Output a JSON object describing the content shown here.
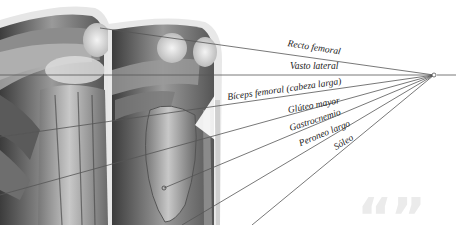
{
  "diagram": {
    "hub": {
      "x": 434,
      "y": 75
    },
    "labels": [
      {
        "text": "Recto femoral",
        "x": 287,
        "y": 42,
        "rotate": 9
      },
      {
        "text": "Vasto lateral",
        "x": 290,
        "y": 62,
        "rotate": 0
      },
      {
        "text": "Bíceps femoral (cabeza larga)",
        "x": 228,
        "y": 88,
        "rotate": -8
      },
      {
        "text": "Glúteo mayor",
        "x": 289,
        "y": 100,
        "rotate": -11
      },
      {
        "text": "Gastrocnemio",
        "x": 292,
        "y": 118,
        "rotate": -17
      },
      {
        "text": "Peroneo largo",
        "x": 302,
        "y": 135,
        "rotate": -22
      },
      {
        "text": "Sóleo",
        "x": 338,
        "y": 141,
        "rotate": -31
      }
    ],
    "leader_lines": [
      {
        "name": "recto-femoral",
        "x2": 100,
        "y2": 28
      },
      {
        "name": "vasto-lateral",
        "x2": 0,
        "y2": 75
      },
      {
        "name": "biceps-femoral",
        "x2": 0,
        "y2": 137
      },
      {
        "name": "gluteo-mayor",
        "x2": 0,
        "y2": 195
      },
      {
        "name": "gastrocnemio",
        "x2": 164,
        "y2": 188
      },
      {
        "name": "peroneo-largo",
        "x2": 182,
        "y2": 225
      },
      {
        "name": "soleo",
        "x2": 252,
        "y2": 225
      }
    ],
    "watermark": "“”",
    "colors": {
      "line": "#555555",
      "muscle_dark": "#4a4a4a",
      "muscle_light": "#d9d9d9",
      "watermark": "#ebebeb"
    }
  }
}
